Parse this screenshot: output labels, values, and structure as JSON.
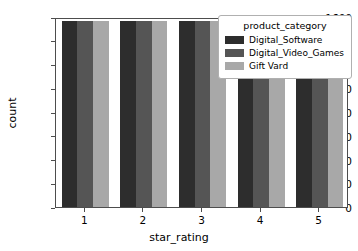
{
  "chart_data": {
    "type": "bar",
    "title": "",
    "xlabel": "star_rating",
    "ylabel": "count",
    "categories": [
      "1",
      "2",
      "3",
      "4",
      "5"
    ],
    "series": [
      {
        "name": "Digital_Software",
        "color": "#2d2d2d",
        "values": [
          1570,
          1570,
          1570,
          1570,
          1570
        ]
      },
      {
        "name": "Digital_Video_Games",
        "color": "#555555",
        "values": [
          1570,
          1570,
          1570,
          1570,
          1570
        ]
      },
      {
        "name": "Gift Vard",
        "color": "#a8a8a8",
        "values": [
          1570,
          1570,
          1570,
          1570,
          1570
        ]
      }
    ],
    "ylim": [
      0,
      1600
    ],
    "yticks": [
      0,
      200,
      400,
      600,
      800,
      1000,
      1200,
      1400,
      1600
    ],
    "ytick_labels": [
      "0",
      "200",
      "400",
      "600",
      "800",
      "1000",
      "1200",
      "1400",
      "1600"
    ],
    "xtick_labels": [
      "1",
      "2",
      "3",
      "4",
      "5"
    ],
    "grid": false,
    "legend": {
      "title": "product_category",
      "position": "upper right",
      "entries": [
        "Digital_Software",
        "Digital_Video_Games",
        "Gift Vard"
      ]
    }
  },
  "colors": {
    "background": "#ffffff",
    "axis": "#4d4d4d",
    "text": "#000000",
    "legend_border": "#b0b0b0"
  }
}
